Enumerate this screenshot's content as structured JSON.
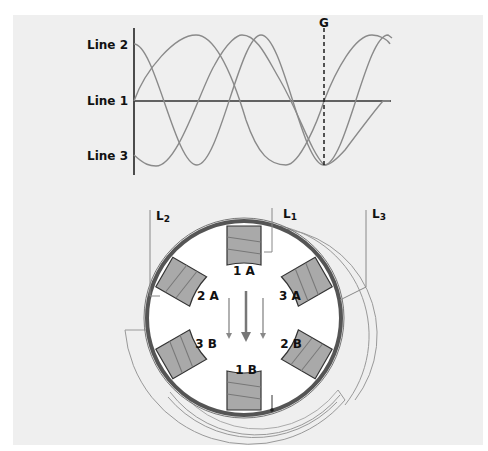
{
  "diagram": {
    "waveform": {
      "labels": [
        "Line 2",
        "Line 1",
        "Line 3"
      ],
      "marker_label": "G"
    },
    "motor": {
      "leads": [
        "L2",
        "L1",
        "L3"
      ],
      "lead_subscripts": [
        "2",
        "1",
        "3"
      ],
      "poles": [
        "1 A",
        "2 A",
        "3 A",
        "3 B",
        "2 B",
        "1 B"
      ]
    }
  },
  "colors": {
    "background": "#efefef",
    "wave": "#8a8a8a",
    "axis": "#222222",
    "pole_fill": "#a9a9a9",
    "ring": "#555555",
    "wire": "#909090"
  }
}
